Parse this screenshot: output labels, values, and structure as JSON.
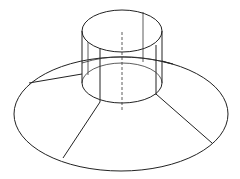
{
  "figure": {
    "stroke_color": "#222222",
    "background": "#ffffff"
  },
  "shapes": {
    "top_ellipse": {
      "cx": 122,
      "cy": 31,
      "rx": 40,
      "ry": 21
    },
    "cylinder_bottom_ellipse": {
      "cx": 122,
      "cy": 83,
      "rx": 40,
      "ry": 20
    },
    "base_ellipse": {
      "cx": 121,
      "cy": 114,
      "rx": 107,
      "ry": 57
    },
    "inner_rim_ellipse": {
      "cx": 122,
      "cy": 75,
      "rx": 52,
      "ry": 18
    }
  }
}
